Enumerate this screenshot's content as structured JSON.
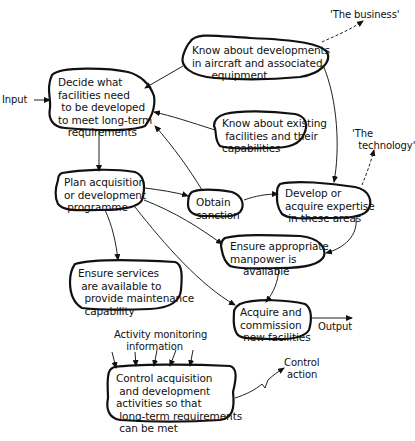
{
  "diagram": {
    "type": "activity-flow-diagram",
    "nodes": [
      {
        "id": "decide",
        "text": "Decide what\nfacilities need\n to be developed\nto meet long-term\n   requirements"
      },
      {
        "id": "know_dev",
        "text": "Know about developments\nin aircraft and associated\n      equipment"
      },
      {
        "id": "know_exist",
        "text": "Know about existing\n facilities and their\ncapabilities"
      },
      {
        "id": "plan",
        "text": "Plan acquisition\nor development\n programme"
      },
      {
        "id": "sanction",
        "text": "Obtain\nsanction"
      },
      {
        "id": "expertise",
        "text": "Develop or\nacquire expertise\n in these areas"
      },
      {
        "id": "manpower",
        "text": "Ensure appropriate\nmanpower is\n    available"
      },
      {
        "id": "services",
        "text": "Ensure services\n are available to\n  provide maintenance\n  capability"
      },
      {
        "id": "acquire",
        "text": "Acquire and\ncommission\n new facilities"
      },
      {
        "id": "control",
        "text": "Control acquisition\n and development\nactivities so that\n long-term requirements\n can be met"
      }
    ],
    "labels": {
      "input": "Input",
      "output": "Output",
      "business": "'The business'",
      "technology": "'The\n  technology'",
      "monitoring": "Activity monitoring\n    information",
      "control_action": "Control\n action"
    },
    "edges": [
      {
        "from": "input",
        "to": "decide"
      },
      {
        "from": "know_dev",
        "to": "decide"
      },
      {
        "from": "know_exist",
        "to": "decide"
      },
      {
        "from": "sanction",
        "to": "decide"
      },
      {
        "from": "decide",
        "to": "plan"
      },
      {
        "from": "plan",
        "to": "sanction"
      },
      {
        "from": "sanction",
        "to": "expertise"
      },
      {
        "from": "know_dev",
        "to": "expertise"
      },
      {
        "from": "plan",
        "to": "manpower"
      },
      {
        "from": "plan",
        "to": "services"
      },
      {
        "from": "plan",
        "to": "acquire"
      },
      {
        "from": "expertise",
        "to": "manpower"
      },
      {
        "from": "manpower",
        "to": "acquire"
      },
      {
        "from": "acquire",
        "to": "output"
      },
      {
        "from": "know_dev",
        "to": "business",
        "style": "dashed"
      },
      {
        "from": "expertise",
        "to": "technology",
        "style": "dashed"
      },
      {
        "from": "monitoring",
        "to": "control"
      },
      {
        "from": "control",
        "to": "control_action"
      }
    ]
  }
}
